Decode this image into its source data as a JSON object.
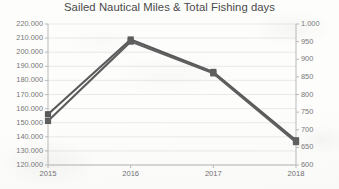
{
  "chart_data": {
    "type": "line",
    "title": "Sailed Nautical Miles & Total Fishing days",
    "xlabel": "",
    "ylabel": "",
    "categories": [
      "2015",
      "2016",
      "2017",
      "2018"
    ],
    "grid": true,
    "legend": "none",
    "series": [
      {
        "name": "Sailed Nautical Miles",
        "axis": "left",
        "color": "#595959",
        "marker": "square",
        "values": [
          156000,
          209000,
          186000,
          137500
        ]
      },
      {
        "name": "Total Fishing days",
        "axis": "right",
        "color": "#5e5e5e",
        "marker": "square",
        "values": [
          725,
          950,
          860,
          665
        ]
      }
    ],
    "y_left": {
      "min": 120000,
      "max": 220000,
      "step": 10000,
      "ticks": [
        "120.000",
        "130.000",
        "140.000",
        "150.000",
        "160.000",
        "170.000",
        "180.000",
        "190.000",
        "200.000",
        "210.000",
        "220.000"
      ]
    },
    "y_right": {
      "min": 600,
      "max": 1000,
      "step": 50,
      "ticks": [
        "600",
        "650",
        "700",
        "750",
        "800",
        "850",
        "900",
        "950",
        "1.000"
      ]
    },
    "x_ticks": [
      "2015",
      "2016",
      "2017",
      "2018"
    ],
    "colors": {
      "line": "#595959",
      "gridline": "#e3e3e3",
      "axis": "#b9b9b9",
      "text": "#6e6e6e",
      "title": "#4a4a4a",
      "background": "#fdfdfc"
    }
  }
}
